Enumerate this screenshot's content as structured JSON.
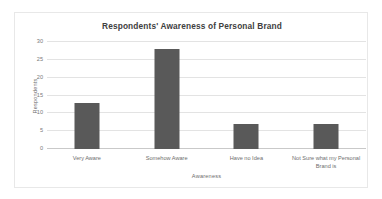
{
  "chart_data": {
    "type": "bar",
    "title": "Respondents' Awareness of Personal Brand",
    "xlabel": "Awareness",
    "ylabel": "Respondents",
    "categories": [
      "Very Aware",
      "Somehow Aware",
      "Have no Idea",
      "Not Sure what my Personal Brand is"
    ],
    "values": [
      13,
      28,
      7,
      7
    ],
    "yticks": [
      0,
      5,
      10,
      15,
      20,
      25,
      30
    ],
    "ytick_labels": [
      "0",
      "5",
      "10",
      "15",
      "20",
      "25",
      "30"
    ],
    "ylim": [
      0,
      30
    ],
    "grid": true,
    "legend": null,
    "series": [
      {
        "name": "Respondents",
        "values": [
          13,
          28,
          7,
          7
        ],
        "color": "#595959"
      }
    ],
    "colors": {
      "bar": "#595959",
      "gridline": "#e3e3e3",
      "axis": "#c9c9c9",
      "title_text": "#404040",
      "label_text": "#6e6e6e",
      "frame": "#e8e8e8",
      "background": "#ffffff"
    }
  }
}
